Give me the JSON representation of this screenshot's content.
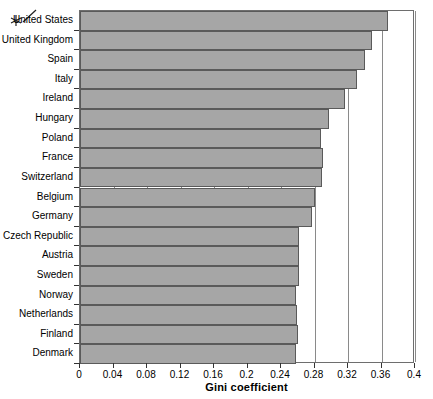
{
  "chart_data": {
    "type": "bar",
    "orientation": "horizontal",
    "title": "",
    "xlabel": "Gini coefficient",
    "ylabel": "",
    "xlim": [
      0,
      0.4
    ],
    "ylim": null,
    "grid": true,
    "legend": null,
    "xticks": [
      "0",
      "0.04",
      "0.08",
      "0.12",
      "0.16",
      "0.2",
      "0.24",
      "0.28",
      "0.32",
      "0.36",
      "0.4"
    ],
    "xtick_values": [
      0,
      0.04,
      0.08,
      0.12,
      0.16,
      0.2,
      0.24,
      0.28,
      0.32,
      0.36,
      0.4
    ],
    "categories": [
      "United States",
      "United Kingdom",
      "Spain",
      "Italy",
      "Ireland",
      "Hungary",
      "Poland",
      "France",
      "Switzerland",
      "Belgium",
      "Germany",
      "Czech Republic",
      "Austria",
      "Sweden",
      "Norway",
      "Netherlands",
      "Finland",
      "Denmark"
    ],
    "values": [
      0.368,
      0.349,
      0.34,
      0.331,
      0.316,
      0.297,
      0.288,
      0.29,
      0.289,
      0.281,
      0.277,
      0.262,
      0.262,
      0.262,
      0.258,
      0.259,
      0.26,
      0.258
    ],
    "bar_color": "#a6a6a6",
    "bar_edge_color": "#5a5a5a"
  },
  "annotation": {
    "mark": "hand-drawn-arrow",
    "points_to": "United States"
  },
  "axis": {
    "x_title": "Gini coefficient"
  }
}
